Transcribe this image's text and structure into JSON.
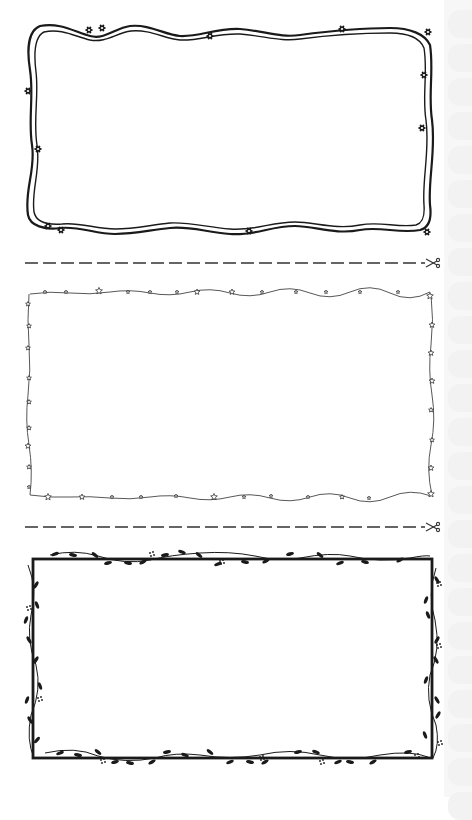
{
  "page": {
    "background": "#ffffff",
    "ink_color": "#1a1a1a",
    "light_ink_color": "#444444",
    "edge_strip_color": "#f7f7f7"
  },
  "frames": [
    {
      "id": "wavy-ribbon-frame",
      "style": "double wavy ribbon with small flowers",
      "flower_count": 12
    },
    {
      "id": "star-stitch-frame",
      "style": "dashed stitch line with small stars",
      "star_count": 40
    },
    {
      "id": "vine-leaf-frame",
      "style": "straight rectangle with leafy vines and berries"
    }
  ],
  "cut_lines": [
    {
      "id": "cut-line-1",
      "style": "dashed",
      "icon": "scissors-icon"
    },
    {
      "id": "cut-line-2",
      "style": "dashed",
      "icon": "scissors-icon"
    }
  ]
}
